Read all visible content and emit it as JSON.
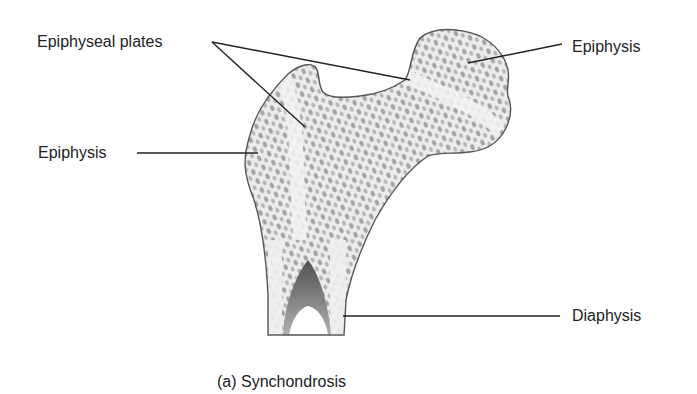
{
  "figure": {
    "caption": "(a) Synchondrosis",
    "colors": {
      "background": "#ffffff",
      "outline": "#555555",
      "bone_fill": "#ececec",
      "cell_fill": "#9a9a9a",
      "plate_fill": "#f4f4f4",
      "cavity_dark": "#6a6a6a",
      "leader_line": "#222222",
      "text": "#222222"
    }
  },
  "labels": {
    "epiphyseal_plates": "Epiphyseal plates",
    "epiphysis_left": "Epiphysis",
    "epiphysis_right": "Epiphysis",
    "diaphysis": "Diaphysis"
  }
}
